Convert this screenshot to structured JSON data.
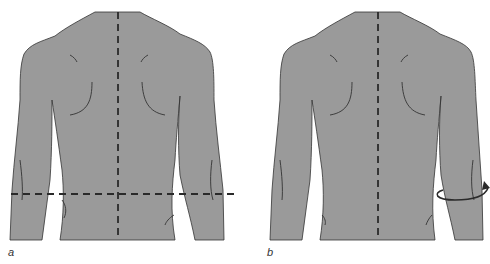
{
  "figure": {
    "panels": [
      {
        "label": "a",
        "description": "Back view of torso and arms with vertical midline and horizontal dashed reference line at waist level"
      },
      {
        "label": "b",
        "description": "Back view of torso and arms with vertical midline; curved rotation arrow around right forearm"
      }
    ]
  },
  "colors": {
    "body_fill": "#9a9a9a",
    "outline": "#333333",
    "dash": "#2a2a2a"
  }
}
